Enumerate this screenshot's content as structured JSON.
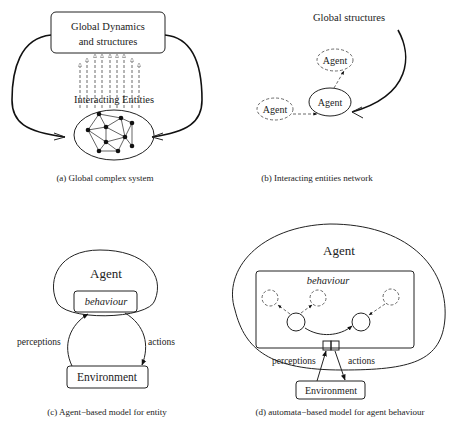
{
  "panels": {
    "a": {
      "caption": "(a) Global complex system",
      "box_line1": "Global Dynamics",
      "box_line2": "and structures",
      "entities_label": "Interacting Entities"
    },
    "b": {
      "caption": "(b) Interacting entities network",
      "global_label": "Global structures",
      "agent_top": "Agent",
      "agent_center": "Agent",
      "agent_left": "Agent"
    },
    "c": {
      "caption": "(c) Agent−based model for entity",
      "agent": "Agent",
      "behaviour": "behaviour",
      "perceptions": "perceptions",
      "actions": "actions",
      "environment": "Environment"
    },
    "d": {
      "caption": "(d) automata−based model for agent behaviour",
      "agent": "Agent",
      "behaviour": "behaviour",
      "perceptions": "perceptions",
      "actions": "actions",
      "environment": "Environment"
    }
  }
}
